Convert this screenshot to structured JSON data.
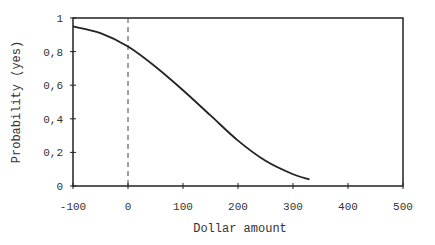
{
  "chart_data": {
    "type": "line",
    "title": "",
    "xlabel": "Dollar amount",
    "ylabel": "Probability (yes)",
    "xlim": [
      -100,
      500
    ],
    "ylim": [
      0,
      1
    ],
    "x_ticks": [
      "-100",
      "0",
      "100",
      "200",
      "300",
      "400",
      "500"
    ],
    "y_ticks": [
      "0",
      "0,2",
      "0,4",
      "0,6",
      "0,8",
      "1"
    ],
    "grid": false,
    "legend": null,
    "reference_line": {
      "x": 0,
      "style": "dashed"
    },
    "series": [
      {
        "name": "Probability (yes)",
        "x": [
          -100,
          -50,
          0,
          50,
          100,
          150,
          200,
          250,
          300,
          330
        ],
        "values": [
          0.95,
          0.91,
          0.83,
          0.71,
          0.57,
          0.42,
          0.27,
          0.15,
          0.07,
          0.04
        ]
      }
    ]
  }
}
